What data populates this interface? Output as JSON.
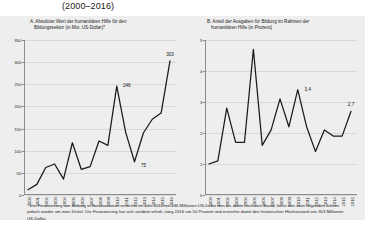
{
  "doc": {
    "title": "(2000–2016)"
  },
  "panels": [
    {
      "key": "a",
      "heading_line1": "A. Absoluter Wert der humanitären Hilfe für den",
      "heading_line2": "Bildungssektor (in Mio. US-Dollar)*"
    },
    {
      "key": "b",
      "heading_line1": "B. Anteil der Ausgaben für Bildung im Rahmen der",
      "heading_line2": "humanitären Hilfe (in Prozent)"
    }
  ],
  "footnote": "* Die Finanzierung von Bildung in Notsituationen erreichte im Jahr 2010 mit 246 Millionen US-Dollar den bis dahin höchsten Stand, fiel in den zwei folgenden Jahren jedoch wieder um zwei Drittel. Die Finanzierung hat sich seitdem erholt, stieg 2016 um 50 Prozent und erreichte damit den historischen Höchststand von 303 Millionen US-Dollar.",
  "colors": {
    "figure_background": "#eeeeee",
    "line": "#1a1a1a",
    "axis": "#8c8c8c",
    "grid": "#d8d8d8",
    "text": "#1a1a1a"
  },
  "chart_data": [
    {
      "type": "line",
      "panel": "A",
      "title": "A. Absoluter Wert der humanitären Hilfe für den Bildungssektor (in Mio. US-Dollar)*",
      "xlabel": "",
      "ylabel": "",
      "grid": true,
      "legend": "none",
      "ylim": [
        0,
        350
      ],
      "yticks": [
        0,
        50,
        100,
        150,
        200,
        250,
        300,
        350
      ],
      "categories": [
        "2000",
        "2001",
        "2002",
        "2003",
        "2004",
        "2005",
        "2006",
        "2007",
        "2008",
        "2009",
        "2010",
        "2011",
        "2012",
        "2013",
        "2014",
        "2015",
        "2016"
      ],
      "values": [
        12,
        24,
        62,
        70,
        36,
        118,
        58,
        64,
        122,
        112,
        246,
        142,
        75,
        140,
        171,
        185,
        303
      ],
      "annotations": [
        {
          "category": "2010",
          "value": 246,
          "label": "246"
        },
        {
          "category": "2012",
          "value": 75,
          "label": "75"
        },
        {
          "category": "2016",
          "value": 303,
          "label": "303"
        }
      ]
    },
    {
      "type": "line",
      "panel": "B",
      "title": "B. Anteil der Ausgaben für Bildung im Rahmen der humanitären Hilfe (in Prozent)",
      "xlabel": "",
      "ylabel": "",
      "grid": true,
      "legend": "none",
      "ylim": [
        0,
        5
      ],
      "yticks": [
        0,
        1,
        2,
        3,
        4,
        5
      ],
      "categories": [
        "2000",
        "2001",
        "2002",
        "2003",
        "2004",
        "2005",
        "2006",
        "2007",
        "2008",
        "2009",
        "2010",
        "2011",
        "2012",
        "2013",
        "2014",
        "2015",
        "2016"
      ],
      "values": [
        1.0,
        1.1,
        2.8,
        1.7,
        1.7,
        4.7,
        1.6,
        2.1,
        3.1,
        2.2,
        3.4,
        2.2,
        1.4,
        2.1,
        1.9,
        1.9,
        2.7
      ],
      "annotations": [
        {
          "category": "2010",
          "value": 3.4,
          "label": "3,4"
        },
        {
          "category": "2016",
          "value": 2.7,
          "label": "2,7"
        }
      ]
    }
  ]
}
